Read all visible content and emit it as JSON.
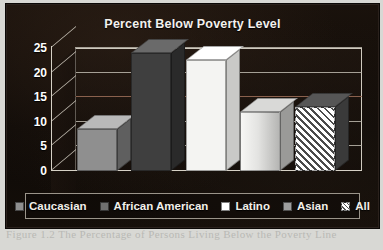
{
  "page": {
    "bleed_text": "Figure 1.2  The Percentage of Persons Living Below the Poverty Line"
  },
  "chart_data": {
    "type": "bar",
    "title": "Percent Below Poverty Level",
    "xlabel": "",
    "ylabel": "",
    "categories": [
      "Caucasian",
      "African American",
      "Latino",
      "Asian",
      "All"
    ],
    "values": [
      8.5,
      24,
      22.5,
      12,
      13
    ],
    "ylim": [
      0,
      25
    ],
    "yticks": [
      0,
      5,
      10,
      15,
      20,
      25
    ],
    "ytick_labels": [
      "0",
      "5",
      "10",
      "15",
      "20",
      "25"
    ],
    "grid": true,
    "legend_position": "bottom",
    "series_styles": [
      {
        "name": "Caucasian",
        "fill": "#8f8f8f",
        "top": "#b9b9b9",
        "side": "#5f5f5f",
        "swatch": "#8f8f8f",
        "pattern": "solid"
      },
      {
        "name": "African American",
        "fill": "#3f3f3f",
        "top": "#6a6a6a",
        "side": "#2a2a2a",
        "swatch": "#6f6f6f",
        "pattern": "solid"
      },
      {
        "name": "Latino",
        "fill": "#f4f4f2",
        "top": "#ffffff",
        "side": "#c9c9c7",
        "swatch": "#ffffff",
        "pattern": "solid"
      },
      {
        "name": "Asian",
        "fill": "#e6e6e4",
        "top": "#d9d9d7",
        "side": "#9a9a98",
        "swatch": "#9e9e9e",
        "pattern": "gradient"
      },
      {
        "name": "All",
        "fill": "#ededeb",
        "top": "#565656",
        "side": "#3a3a3a",
        "swatch": "#d8d8d6",
        "pattern": "hatch"
      }
    ]
  },
  "colors": {
    "background": "#120d0a",
    "axis": "#d6d1c6",
    "grid": "#bdb8ae",
    "grid_accent": "#9d6f58",
    "title_text": "#f3f1ee",
    "legend_border": "#9a948a"
  }
}
